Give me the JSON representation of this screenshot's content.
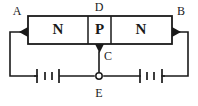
{
  "diagram": {
    "type": "circuit-schematic",
    "canvas": {
      "width": 198,
      "height": 106
    },
    "colors": {
      "ink": "#1a1a1a",
      "background": "#ffffff"
    },
    "semiconductor_bar": {
      "regions": [
        {
          "id": "region-left",
          "label": "N",
          "type": "n-type"
        },
        {
          "id": "region-middle",
          "label": "P",
          "type": "p-type"
        },
        {
          "id": "region-right",
          "label": "N",
          "type": "n-type"
        }
      ]
    },
    "terminals": [
      {
        "id": "terminal-a",
        "label": "A",
        "position": "top-left",
        "kind": "arrow-in"
      },
      {
        "id": "terminal-b",
        "label": "B",
        "position": "top-right",
        "kind": "arrow-out"
      },
      {
        "id": "terminal-d",
        "label": "D",
        "position": "top-center",
        "kind": "plain"
      },
      {
        "id": "terminal-c",
        "label": "C",
        "position": "center-below-bar",
        "kind": "arrow-down"
      },
      {
        "id": "terminal-e",
        "label": "E",
        "position": "bottom-center",
        "kind": "open-node"
      }
    ],
    "batteries": [
      {
        "id": "battery-left",
        "cells": 2,
        "position": "bottom-left"
      },
      {
        "id": "battery-right",
        "cells": 2,
        "position": "bottom-right"
      }
    ]
  }
}
